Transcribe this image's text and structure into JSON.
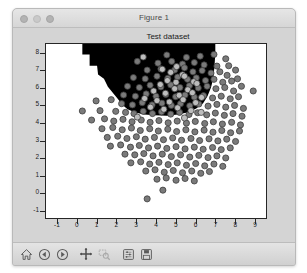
{
  "window": {
    "title": "Figure 1",
    "controls": [
      {
        "name": "close-button",
        "label": "close"
      },
      {
        "name": "minimize-button",
        "label": "minimize"
      },
      {
        "name": "maximize-button",
        "label": "maximize"
      }
    ]
  },
  "toolbar": {
    "buttons": [
      {
        "name": "home-button",
        "icon": "home-icon",
        "tooltip": "Reset original view"
      },
      {
        "name": "back-button",
        "icon": "back-arrow-icon",
        "tooltip": "Back to previous view"
      },
      {
        "name": "forward-button",
        "icon": "forward-arrow-icon",
        "tooltip": "Forward to next view"
      },
      {
        "name": "pan-button",
        "icon": "pan-move-icon",
        "tooltip": "Pan axes with left mouse, zoom with right"
      },
      {
        "name": "zoom-button",
        "icon": "zoom-rect-icon",
        "tooltip": "Zoom to rectangle"
      },
      {
        "name": "configure-button",
        "icon": "sliders-icon",
        "tooltip": "Configure subplots"
      },
      {
        "name": "save-button",
        "icon": "floppy-save-icon",
        "tooltip": "Save the figure"
      }
    ]
  },
  "colors": {
    "window_chrome": "#d2d2d2",
    "titlebar": "#e6e6e6",
    "figure_background": "#d4d4d4",
    "axes_background": "#ffffff",
    "axes_edge": "#262626",
    "region_fill": "#000000",
    "point_face": "#7a7a7a",
    "point_edge": "#3c3c3c",
    "point_light": "#bdbdbd"
  },
  "chart_data": {
    "type": "scatter",
    "title": "Test dataset",
    "xlabel": "",
    "ylabel": "",
    "xlim": [
      -1.6,
      9.6
    ],
    "ylim": [
      -1.45,
      8.55
    ],
    "xticks": [
      -1,
      0,
      1,
      2,
      3,
      4,
      5,
      6,
      7,
      8,
      9
    ],
    "yticks": [
      -1,
      0,
      1,
      2,
      3,
      4,
      5,
      6,
      7,
      8
    ],
    "grid": false,
    "legend": null,
    "annotations": [
      {
        "kind": "decision-region",
        "label": "predicted class region (black)",
        "fill": "#000000",
        "description": "Filled contour region covering the upper portion of the axes; left boundary descends diagonally from about x=0.2 at the top toward x=2.6 at y=4.6, right boundary descends near x=7.0 from the top down to about y=5.0, bottom boundary curves through the dense cluster near y=4.6.",
        "polygon": [
          [
            0.25,
            8.55
          ],
          [
            0.25,
            7.95
          ],
          [
            0.62,
            7.95
          ],
          [
            0.62,
            7.3
          ],
          [
            1.0,
            7.3
          ],
          [
            1.05,
            6.8
          ],
          [
            1.35,
            6.55
          ],
          [
            1.55,
            6.1
          ],
          [
            1.8,
            5.75
          ],
          [
            2.05,
            5.4
          ],
          [
            2.3,
            5.05
          ],
          [
            2.55,
            4.8
          ],
          [
            2.95,
            4.62
          ],
          [
            3.4,
            4.5
          ],
          [
            3.95,
            4.45
          ],
          [
            4.55,
            4.42
          ],
          [
            5.1,
            4.5
          ],
          [
            5.6,
            4.62
          ],
          [
            6.05,
            4.85
          ],
          [
            6.4,
            5.15
          ],
          [
            6.62,
            5.55
          ],
          [
            6.8,
            6.05
          ],
          [
            6.92,
            6.6
          ],
          [
            6.98,
            7.3
          ],
          [
            7.02,
            8.0
          ],
          [
            7.02,
            8.55
          ]
        ]
      }
    ],
    "series": [
      {
        "name": "test samples",
        "marker": "o",
        "facecolor": "#7a7a7a",
        "edgecolor": "#3c3c3c",
        "size": 26,
        "n_points": 300,
        "points": [
          [
            4.55,
            7.92
          ],
          [
            5.55,
            7.78
          ],
          [
            6.25,
            7.85
          ],
          [
            6.95,
            7.95
          ],
          [
            7.55,
            7.7
          ],
          [
            3.05,
            7.55
          ],
          [
            4.1,
            7.45
          ],
          [
            4.8,
            7.55
          ],
          [
            5.35,
            7.4
          ],
          [
            5.95,
            7.48
          ],
          [
            6.45,
            7.35
          ],
          [
            7.1,
            7.28
          ],
          [
            7.7,
            7.3
          ],
          [
            8.05,
            7.05
          ],
          [
            3.55,
            7.05
          ],
          [
            4.25,
            7.12
          ],
          [
            4.95,
            7.05
          ],
          [
            5.45,
            7.18
          ],
          [
            5.88,
            6.95
          ],
          [
            6.35,
            7.02
          ],
          [
            6.8,
            6.88
          ],
          [
            7.25,
            6.95
          ],
          [
            7.62,
            6.75
          ],
          [
            8.15,
            6.55
          ],
          [
            2.85,
            6.62
          ],
          [
            3.45,
            6.55
          ],
          [
            4.05,
            6.7
          ],
          [
            4.6,
            6.58
          ],
          [
            5.1,
            6.65
          ],
          [
            5.6,
            6.52
          ],
          [
            6.05,
            6.6
          ],
          [
            6.52,
            6.45
          ],
          [
            6.95,
            6.52
          ],
          [
            7.4,
            6.35
          ],
          [
            7.85,
            6.42
          ],
          [
            8.35,
            6.12
          ],
          [
            2.55,
            6.12
          ],
          [
            3.15,
            6.05
          ],
          [
            3.7,
            6.18
          ],
          [
            4.25,
            6.08
          ],
          [
            4.75,
            6.2
          ],
          [
            5.22,
            6.05
          ],
          [
            5.7,
            6.15
          ],
          [
            6.15,
            6.02
          ],
          [
            6.6,
            6.12
          ],
          [
            7.05,
            5.98
          ],
          [
            7.5,
            6.05
          ],
          [
            7.95,
            5.85
          ],
          [
            8.95,
            5.85
          ],
          [
            2.35,
            5.62
          ],
          [
            2.95,
            5.55
          ],
          [
            3.5,
            5.68
          ],
          [
            4.0,
            5.55
          ],
          [
            4.5,
            5.65
          ],
          [
            5.0,
            5.52
          ],
          [
            5.48,
            5.62
          ],
          [
            5.95,
            5.5
          ],
          [
            6.42,
            5.58
          ],
          [
            6.88,
            5.45
          ],
          [
            7.32,
            5.55
          ],
          [
            7.78,
            5.4
          ],
          [
            8.2,
            5.52
          ],
          [
            0.95,
            5.28
          ],
          [
            1.72,
            5.35
          ],
          [
            2.25,
            5.12
          ],
          [
            2.8,
            5.05
          ],
          [
            3.3,
            5.18
          ],
          [
            3.8,
            5.05
          ],
          [
            4.3,
            5.15
          ],
          [
            4.78,
            5.02
          ],
          [
            5.25,
            5.12
          ],
          [
            5.72,
            5.0
          ],
          [
            6.18,
            5.1
          ],
          [
            6.65,
            4.98
          ],
          [
            7.1,
            5.08
          ],
          [
            7.55,
            4.92
          ],
          [
            8.0,
            5.02
          ],
          [
            8.45,
            4.85
          ],
          [
            0.25,
            4.7
          ],
          [
            1.15,
            4.72
          ],
          [
            1.95,
            4.68
          ],
          [
            2.45,
            4.62
          ],
          [
            2.88,
            4.55
          ],
          [
            3.35,
            4.68
          ],
          [
            3.82,
            4.55
          ],
          [
            4.28,
            4.65
          ],
          [
            4.75,
            4.52
          ],
          [
            5.2,
            4.62
          ],
          [
            5.68,
            4.5
          ],
          [
            6.12,
            4.6
          ],
          [
            6.58,
            4.48
          ],
          [
            7.02,
            4.58
          ],
          [
            7.48,
            4.45
          ],
          [
            7.92,
            4.55
          ],
          [
            8.38,
            4.4
          ],
          [
            0.72,
            4.18
          ],
          [
            1.38,
            4.25
          ],
          [
            1.85,
            4.12
          ],
          [
            2.32,
            4.22
          ],
          [
            2.78,
            4.08
          ],
          [
            3.25,
            4.18
          ],
          [
            3.7,
            4.05
          ],
          [
            4.15,
            4.15
          ],
          [
            4.62,
            4.02
          ],
          [
            5.08,
            4.12
          ],
          [
            5.55,
            4.0
          ],
          [
            6.0,
            4.1
          ],
          [
            6.48,
            3.98
          ],
          [
            6.92,
            4.08
          ],
          [
            7.38,
            3.95
          ],
          [
            7.85,
            4.05
          ],
          [
            8.3,
            3.9
          ],
          [
            1.25,
            3.68
          ],
          [
            1.8,
            3.75
          ],
          [
            2.28,
            3.62
          ],
          [
            2.75,
            3.72
          ],
          [
            3.2,
            3.58
          ],
          [
            3.68,
            3.68
          ],
          [
            4.12,
            3.55
          ],
          [
            4.6,
            3.65
          ],
          [
            5.05,
            3.52
          ],
          [
            5.52,
            3.62
          ],
          [
            5.98,
            3.5
          ],
          [
            6.45,
            3.6
          ],
          [
            6.9,
            3.48
          ],
          [
            7.35,
            3.58
          ],
          [
            7.8,
            3.45
          ],
          [
            8.25,
            3.55
          ],
          [
            1.52,
            3.18
          ],
          [
            2.05,
            3.25
          ],
          [
            2.52,
            3.12
          ],
          [
            3.0,
            3.22
          ],
          [
            3.45,
            3.08
          ],
          [
            3.92,
            3.18
          ],
          [
            4.38,
            3.05
          ],
          [
            4.85,
            3.15
          ],
          [
            5.3,
            3.02
          ],
          [
            5.78,
            3.12
          ],
          [
            6.22,
            3.0
          ],
          [
            6.7,
            3.1
          ],
          [
            7.15,
            2.98
          ],
          [
            7.6,
            3.08
          ],
          [
            8.05,
            2.95
          ],
          [
            1.68,
            2.68
          ],
          [
            2.2,
            2.75
          ],
          [
            2.7,
            2.62
          ],
          [
            3.15,
            2.72
          ],
          [
            3.62,
            2.58
          ],
          [
            4.08,
            2.68
          ],
          [
            4.55,
            2.55
          ],
          [
            5.02,
            2.65
          ],
          [
            5.48,
            2.52
          ],
          [
            5.95,
            2.62
          ],
          [
            6.4,
            2.5
          ],
          [
            6.88,
            2.6
          ],
          [
            7.32,
            2.48
          ],
          [
            7.78,
            2.58
          ],
          [
            2.42,
            2.22
          ],
          [
            2.92,
            2.18
          ],
          [
            3.38,
            2.25
          ],
          [
            3.85,
            2.12
          ],
          [
            4.32,
            2.22
          ],
          [
            4.78,
            2.08
          ],
          [
            5.25,
            2.18
          ],
          [
            5.72,
            2.05
          ],
          [
            6.18,
            2.15
          ],
          [
            6.65,
            2.02
          ],
          [
            7.1,
            2.12
          ],
          [
            7.55,
            2.0
          ],
          [
            2.72,
            1.72
          ],
          [
            3.22,
            1.78
          ],
          [
            3.68,
            1.65
          ],
          [
            4.15,
            1.75
          ],
          [
            4.62,
            1.62
          ],
          [
            5.08,
            1.72
          ],
          [
            5.55,
            1.58
          ],
          [
            6.02,
            1.68
          ],
          [
            6.48,
            1.55
          ],
          [
            6.95,
            1.65
          ],
          [
            7.4,
            1.52
          ],
          [
            3.48,
            1.25
          ],
          [
            3.95,
            1.32
          ],
          [
            4.42,
            1.18
          ],
          [
            4.88,
            1.28
          ],
          [
            5.35,
            1.15
          ],
          [
            5.82,
            1.25
          ],
          [
            6.28,
            1.12
          ],
          [
            6.72,
            1.22
          ],
          [
            4.05,
            0.78
          ],
          [
            4.52,
            0.85
          ],
          [
            5.02,
            0.72
          ],
          [
            5.48,
            0.82
          ],
          [
            5.95,
            0.68
          ],
          [
            4.35,
            0.15
          ],
          [
            3.55,
            -0.35
          ]
        ],
        "light_points": [
          [
            3.35,
            7.8
          ],
          [
            4.32,
            7.1
          ],
          [
            4.75,
            6.92
          ],
          [
            5.05,
            7.25
          ],
          [
            5.35,
            6.78
          ],
          [
            4.58,
            6.45
          ],
          [
            5.02,
            6.35
          ],
          [
            5.45,
            6.7
          ],
          [
            5.92,
            6.38
          ],
          [
            4.22,
            6.22
          ],
          [
            4.95,
            5.98
          ],
          [
            5.62,
            5.92
          ],
          [
            6.08,
            6.28
          ],
          [
            3.88,
            5.85
          ],
          [
            4.48,
            5.72
          ],
          [
            5.18,
            5.6
          ],
          [
            5.85,
            5.75
          ],
          [
            6.32,
            5.48
          ],
          [
            3.42,
            5.42
          ],
          [
            4.05,
            5.3
          ],
          [
            4.68,
            5.22
          ],
          [
            5.38,
            5.35
          ],
          [
            6.02,
            5.18
          ],
          [
            3.72,
            4.92
          ],
          [
            4.4,
            4.8
          ],
          [
            5.1,
            4.88
          ],
          [
            5.78,
            4.72
          ],
          [
            6.3,
            4.62
          ],
          [
            5.45,
            4.3
          ],
          [
            3.05,
            4.35
          ]
        ]
      }
    ]
  }
}
